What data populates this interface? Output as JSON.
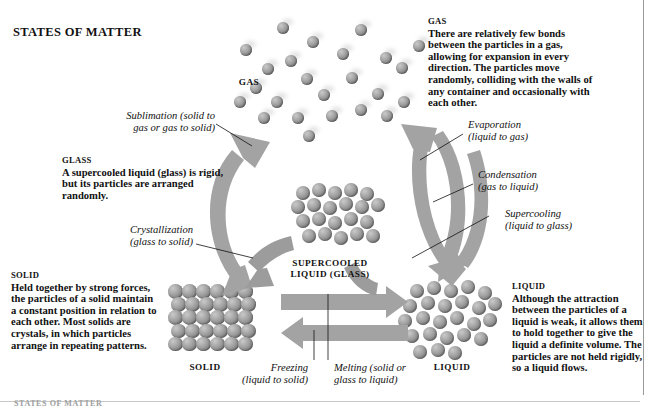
{
  "page": {
    "title": "STATES OF MATTER",
    "footer": "STATES OF MATTER"
  },
  "descriptions": [
    {
      "id": "gas",
      "heading": "GAS",
      "body": "There are relatively few bonds between the particles in a gas, allowing for expansion in every direction. The particles move randomly, colliding with the walls of any container and occasionally with each other."
    },
    {
      "id": "glass",
      "heading": "GLASS",
      "body": "A supercooled liquid (glass) is rigid, but its particles are arranged randomly."
    },
    {
      "id": "solid",
      "heading": "SOLID",
      "body": "Held together by strong forces, the particles of a solid maintain a constant position in relation to each other. Most solids are crystals, in which particles arrange in repeating patterns."
    },
    {
      "id": "liquid",
      "heading": "LIQUID",
      "body": "Although the attraction between the particles of a liquid is weak, it allows them to hold together to give the liquid a definite volume. The particles are not held rigidly, so a liquid flows."
    }
  ],
  "state_labels": {
    "gas": "GAS",
    "solid": "SOLID",
    "liquid": "LIQUID",
    "supercooled_line1": "SUPERCOOLED",
    "supercooled_line2": "LIQUID (GLASS)"
  },
  "transitions": {
    "sublimation_l1": "Sublimation (solid to",
    "sublimation_l2": "gas or gas to solid)",
    "crystallization_l1": "Crystallization",
    "crystallization_l2": "(glass to solid)",
    "evaporation_l1": "Evaporation",
    "evaporation_l2": "(liquid to gas)",
    "condensation_l1": "Condensation",
    "condensation_l2": "(gas to liquid)",
    "supercooling_l1": "Supercooling",
    "supercooling_l2": "(liquid to glass)",
    "freezing_l1": "Freezing",
    "freezing_l2": "(liquid to solid)",
    "melting_l1": "Melting (solid or",
    "melting_l2": "glass to liquid)"
  },
  "colors": {
    "particle_light": "#c9c9c9",
    "particle_mid": "#a6a6a6",
    "particle_dark": "#6f6f6f",
    "arrow_grey": "#a3a3a3",
    "text_black": "#111111",
    "rule_grey": "#9a9a9a"
  },
  "diagram": {
    "type": "state-transition-diagram",
    "states": [
      "solid",
      "liquid",
      "gas",
      "supercooled liquid (glass)"
    ],
    "edges": [
      {
        "from": "solid",
        "to": "gas",
        "label": "Sublimation (solid to gas or gas to solid)",
        "bidirectional": true
      },
      {
        "from": "glass",
        "to": "solid",
        "label": "Crystallization (glass to solid)",
        "bidirectional": false
      },
      {
        "from": "liquid",
        "to": "gas",
        "label": "Evaporation (liquid to gas)",
        "bidirectional": false
      },
      {
        "from": "gas",
        "to": "liquid",
        "label": "Condensation (gas to liquid)",
        "bidirectional": false
      },
      {
        "from": "liquid",
        "to": "glass",
        "label": "Supercooling (liquid to glass)",
        "bidirectional": false
      },
      {
        "from": "liquid",
        "to": "solid",
        "label": "Freezing (liquid to solid)",
        "bidirectional": false
      },
      {
        "from": "solid",
        "to": "liquid",
        "label": "Melting (solid or glass to liquid)",
        "bidirectional": false
      }
    ]
  }
}
